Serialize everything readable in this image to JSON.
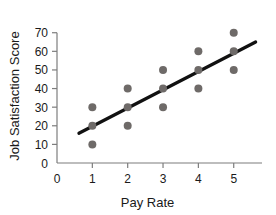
{
  "chart_data": {
    "type": "scatter",
    "title": "",
    "xlabel": "Pay Rate",
    "ylabel": "Job Satisfaction Score",
    "xlim": [
      0,
      5.8
    ],
    "ylim": [
      0,
      72
    ],
    "grid": false,
    "legend": null,
    "xticks": [
      0,
      1,
      2,
      3,
      4,
      5
    ],
    "xtick_labels": [
      "0",
      "1",
      "2",
      "3",
      "4",
      "5"
    ],
    "yticks": [
      0,
      10,
      20,
      30,
      40,
      50,
      60,
      70
    ],
    "ytick_labels": [
      "0",
      "10",
      "20",
      "30",
      "40",
      "50",
      "60",
      "70"
    ],
    "points": [
      {
        "x": 1,
        "y": 30
      },
      {
        "x": 1,
        "y": 20
      },
      {
        "x": 1,
        "y": 10
      },
      {
        "x": 2,
        "y": 40
      },
      {
        "x": 2,
        "y": 30
      },
      {
        "x": 2,
        "y": 20
      },
      {
        "x": 3,
        "y": 50
      },
      {
        "x": 3,
        "y": 40
      },
      {
        "x": 3,
        "y": 30
      },
      {
        "x": 4,
        "y": 60
      },
      {
        "x": 4,
        "y": 50
      },
      {
        "x": 4,
        "y": 40
      },
      {
        "x": 5,
        "y": 70
      },
      {
        "x": 5,
        "y": 60
      },
      {
        "x": 5,
        "y": 50
      }
    ],
    "trend_line": {
      "x1": 0.62,
      "y1": 16,
      "x2": 5.62,
      "y2": 65
    },
    "colors": {
      "point": "#6e6a68",
      "trend_line": "#111111",
      "axis": "#7d7d7d",
      "text": "#1a1a1a",
      "background": "#ffffff"
    },
    "point_radius": 4
  }
}
